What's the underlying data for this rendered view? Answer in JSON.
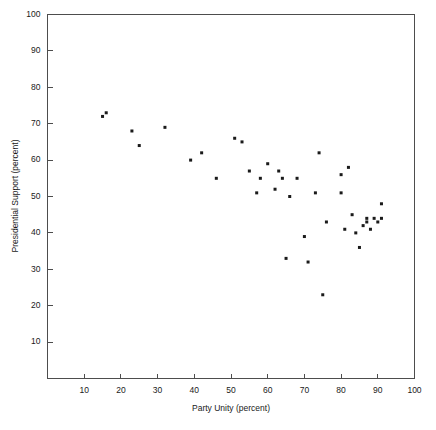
{
  "chart_data": {
    "type": "scatter",
    "title": "",
    "xlabel": "Party Unity (percent)",
    "ylabel": "Presidential Support (percent)",
    "xlim": [
      0,
      100
    ],
    "ylim": [
      0,
      100
    ],
    "xticks": [
      10,
      20,
      30,
      40,
      50,
      60,
      70,
      80,
      90,
      100
    ],
    "yticks": [
      10,
      20,
      30,
      40,
      50,
      60,
      70,
      80,
      90,
      100
    ],
    "grid": false,
    "legend": null,
    "marker": "filled-square",
    "marker_color": "#1a1a1a",
    "points": [
      {
        "x": 15,
        "y": 72
      },
      {
        "x": 16,
        "y": 73
      },
      {
        "x": 23,
        "y": 68
      },
      {
        "x": 25,
        "y": 64
      },
      {
        "x": 32,
        "y": 69
      },
      {
        "x": 39,
        "y": 60
      },
      {
        "x": 42,
        "y": 62
      },
      {
        "x": 46,
        "y": 55
      },
      {
        "x": 51,
        "y": 66
      },
      {
        "x": 53,
        "y": 65
      },
      {
        "x": 55,
        "y": 57
      },
      {
        "x": 57,
        "y": 51
      },
      {
        "x": 58,
        "y": 55
      },
      {
        "x": 60,
        "y": 59
      },
      {
        "x": 62,
        "y": 52
      },
      {
        "x": 63,
        "y": 57
      },
      {
        "x": 64,
        "y": 55
      },
      {
        "x": 65,
        "y": 33
      },
      {
        "x": 66,
        "y": 50
      },
      {
        "x": 68,
        "y": 55
      },
      {
        "x": 70,
        "y": 39
      },
      {
        "x": 71,
        "y": 32
      },
      {
        "x": 73,
        "y": 51
      },
      {
        "x": 74,
        "y": 62
      },
      {
        "x": 75,
        "y": 23
      },
      {
        "x": 76,
        "y": 43
      },
      {
        "x": 80,
        "y": 56
      },
      {
        "x": 80,
        "y": 51
      },
      {
        "x": 81,
        "y": 41
      },
      {
        "x": 82,
        "y": 58
      },
      {
        "x": 83,
        "y": 45
      },
      {
        "x": 84,
        "y": 40
      },
      {
        "x": 85,
        "y": 36
      },
      {
        "x": 86,
        "y": 42
      },
      {
        "x": 87,
        "y": 44
      },
      {
        "x": 87,
        "y": 43
      },
      {
        "x": 88,
        "y": 41
      },
      {
        "x": 89,
        "y": 44
      },
      {
        "x": 90,
        "y": 43
      },
      {
        "x": 91,
        "y": 48
      },
      {
        "x": 91,
        "y": 44
      }
    ]
  }
}
